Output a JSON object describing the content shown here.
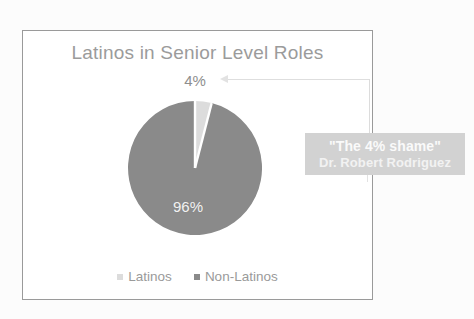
{
  "chart_data": {
    "type": "pie",
    "title": "Latinos in Senior Level Roles",
    "categories": [
      "Latinos",
      "Non-Latinos"
    ],
    "values": [
      4,
      96
    ],
    "data_labels": [
      "4%",
      "96%"
    ],
    "unit": "percent",
    "legend": {
      "position": "bottom",
      "entries": [
        {
          "label": "Latinos",
          "color": "#dcdcdc"
        },
        {
          "label": "Non-Latinos",
          "color": "#8a8a8a"
        }
      ]
    },
    "annotation": {
      "quote": "\"The 4% shame\"",
      "attribution": "Dr. Robert Rodriguez",
      "points_to": "4% slice"
    },
    "colors": {
      "slice_latinos": "#dcdcdc",
      "slice_non_latinos": "#8a8a8a",
      "title_text": "#9b9b9b",
      "callout_background": "#d2d2d2",
      "callout_text": "#fafafa",
      "frame_border": "#9a9a9a",
      "background": "#ffffff"
    }
  },
  "frame": {
    "border_color": "#9a9a9a"
  }
}
